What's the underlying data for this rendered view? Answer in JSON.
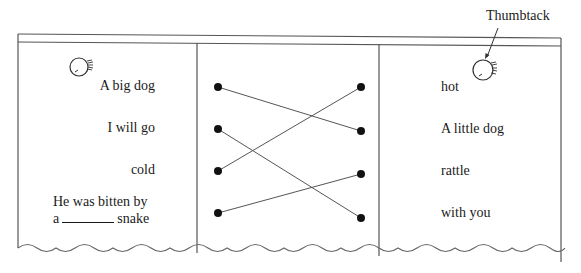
{
  "annotation": {
    "label": "Thumbtack"
  },
  "left_column": {
    "items": [
      {
        "text": "A big dog"
      },
      {
        "text": "I will go"
      },
      {
        "text": "cold"
      },
      {
        "text_line1": "He was bitten by",
        "text_line2_before": "a",
        "text_line2_after": "snake"
      }
    ]
  },
  "right_column": {
    "items": [
      {
        "text": "hot"
      },
      {
        "text": "A little dog"
      },
      {
        "text": "rattle"
      },
      {
        "text": "with you"
      }
    ]
  },
  "matches": [
    {
      "from": "A big dog",
      "to": "A little dog"
    },
    {
      "from": "I will go",
      "to": "with you"
    },
    {
      "from": "cold",
      "to": "hot"
    },
    {
      "from": "He was bitten by a ____ snake",
      "to": "rattle"
    }
  ],
  "colors": {
    "line": "#555555",
    "dot": "#111111",
    "text": "#1a1a1a"
  }
}
